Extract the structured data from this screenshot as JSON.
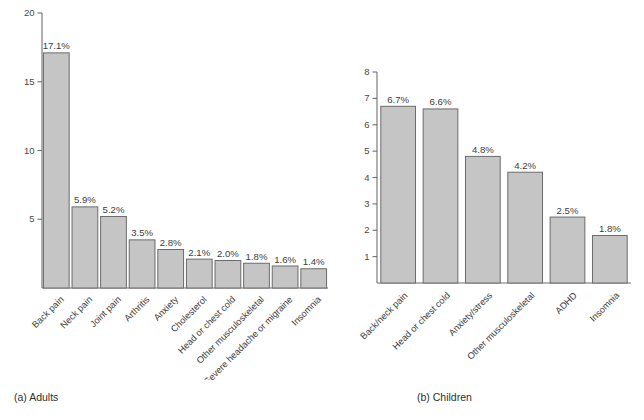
{
  "figure": {
    "panels": [
      {
        "id": "adults",
        "caption": "(a) Adults",
        "chart": {
          "type": "bar",
          "title": "",
          "xlabel": "",
          "ylabel": "",
          "ylim": [
            0,
            20
          ],
          "yticks": [
            5,
            10,
            15,
            20
          ],
          "ytick_labels": [
            "5",
            "10",
            "15",
            "20"
          ],
          "grid": false,
          "legend": false,
          "bar_color": "#c5c5c5",
          "bar_edge_color": "#6b6b6b",
          "categories": [
            "Back pain",
            "Neck pain",
            "Joint pain",
            "Arthritis",
            "Anxiety",
            "Cholesterol",
            "Head or chest cold",
            "Other musculoskeletal",
            "Severe headache or migraine",
            "Insomnia"
          ],
          "values": [
            17.1,
            5.9,
            5.2,
            3.5,
            2.8,
            2.1,
            2.0,
            1.8,
            1.6,
            1.4
          ],
          "value_labels": [
            "17.1%",
            "5.9%",
            "5.2%",
            "3.5%",
            "2.8%",
            "2.1%",
            "2.0%",
            "1.8%",
            "1.6%",
            "1.4%"
          ]
        }
      },
      {
        "id": "children",
        "caption": "(b) Children",
        "chart": {
          "type": "bar",
          "title": "",
          "xlabel": "",
          "ylabel": "",
          "ylim": [
            0,
            8
          ],
          "yticks": [
            1,
            2,
            3,
            4,
            5,
            6,
            7,
            8
          ],
          "ytick_labels": [
            "1",
            "2",
            "3",
            "4",
            "5",
            "6",
            "7",
            "8"
          ],
          "grid": false,
          "legend": false,
          "bar_color": "#c5c5c5",
          "bar_edge_color": "#6b6b6b",
          "categories": [
            "Back/neck pain",
            "Head or chest cold",
            "Anxiety/stress",
            "Other musculoskeletal",
            "ADHD",
            "Insomnia"
          ],
          "values": [
            6.7,
            6.6,
            4.8,
            4.2,
            2.5,
            1.8
          ],
          "value_labels": [
            "6.7%",
            "6.6%",
            "4.8%",
            "4.2%",
            "2.5%",
            "1.8%"
          ]
        }
      }
    ]
  },
  "chart_data": [
    {
      "type": "bar",
      "title": "(a) Adults",
      "xlabel": "",
      "ylabel": "",
      "ylim": [
        0,
        20
      ],
      "grid": false,
      "legend": false,
      "categories": [
        "Back pain",
        "Neck pain",
        "Joint pain",
        "Arthritis",
        "Anxiety",
        "Cholesterol",
        "Head or chest cold",
        "Other musculoskeletal",
        "Severe headache or migraine",
        "Insomnia"
      ],
      "values": [
        17.1,
        5.9,
        5.2,
        3.5,
        2.8,
        2.1,
        2.0,
        1.8,
        1.6,
        1.4
      ],
      "tick_labels": [
        "5",
        "10",
        "15",
        "20"
      ]
    },
    {
      "type": "bar",
      "title": "(b) Children",
      "xlabel": "",
      "ylabel": "",
      "ylim": [
        0,
        8
      ],
      "grid": false,
      "legend": false,
      "categories": [
        "Back/neck pain",
        "Head or chest cold",
        "Anxiety/stress",
        "Other musculoskeletal",
        "ADHD",
        "Insomnia"
      ],
      "values": [
        6.7,
        6.6,
        4.8,
        4.2,
        2.5,
        1.8
      ],
      "tick_labels": [
        "1",
        "2",
        "3",
        "4",
        "5",
        "6",
        "7",
        "8"
      ]
    }
  ]
}
